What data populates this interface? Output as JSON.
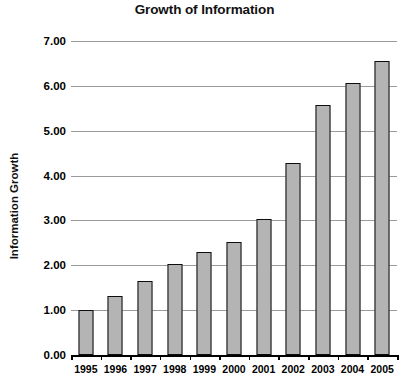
{
  "chart_data": {
    "type": "bar",
    "title": "Growth of Information",
    "xlabel": "",
    "ylabel": "Information Growth",
    "categories": [
      "1995",
      "1996",
      "1997",
      "1998",
      "1999",
      "2000",
      "2001",
      "2002",
      "2003",
      "2004",
      "2005"
    ],
    "values": [
      1.0,
      1.32,
      1.65,
      2.04,
      2.3,
      2.53,
      3.03,
      4.27,
      5.57,
      6.07,
      6.56
    ],
    "ylim": [
      0.0,
      7.0
    ],
    "ytick_labels": [
      "0.00",
      "1.00",
      "2.00",
      "3.00",
      "4.00",
      "5.00",
      "6.00",
      "7.00"
    ],
    "ytick_values": [
      0.0,
      1.0,
      2.0,
      3.0,
      4.0,
      5.0,
      6.0,
      7.0
    ],
    "grid": true,
    "legend": false,
    "series": [
      {
        "name": "Information Growth",
        "values": [
          1.0,
          1.32,
          1.65,
          2.04,
          2.3,
          2.53,
          3.03,
          4.27,
          5.57,
          6.07,
          6.56
        ]
      }
    ],
    "colors": {
      "bar_fill": "#b4b4b4",
      "bar_border": "#0d0d0d",
      "gridline": "#9a9a9a",
      "axis": "#000000",
      "text": "#000000",
      "background": "#ffffff"
    }
  }
}
